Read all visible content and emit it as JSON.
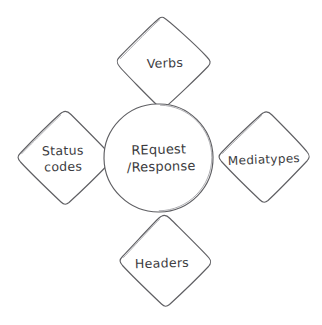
{
  "diagram": {
    "type": "hub-and-spoke",
    "style": "hand-drawn sketch, pencil on white paper",
    "background_color": "#ffffff",
    "stroke_color": "#5f5f63",
    "text_color": "#3b3b40",
    "center": {
      "shape": "circle",
      "name": "request-response",
      "line1": "REquest",
      "line2": "/Response"
    },
    "nodes": [
      {
        "position": "top",
        "shape": "diamond",
        "name": "verbs",
        "line1": "Verbs",
        "line2": ""
      },
      {
        "position": "left",
        "shape": "diamond",
        "name": "status-codes",
        "line1": "Status",
        "line2": "codes"
      },
      {
        "position": "right",
        "shape": "diamond",
        "name": "mediatypes",
        "line1": "Mediatypes",
        "line2": ""
      },
      {
        "position": "bottom",
        "shape": "diamond",
        "name": "headers",
        "line1": "Headers",
        "line2": ""
      }
    ]
  }
}
